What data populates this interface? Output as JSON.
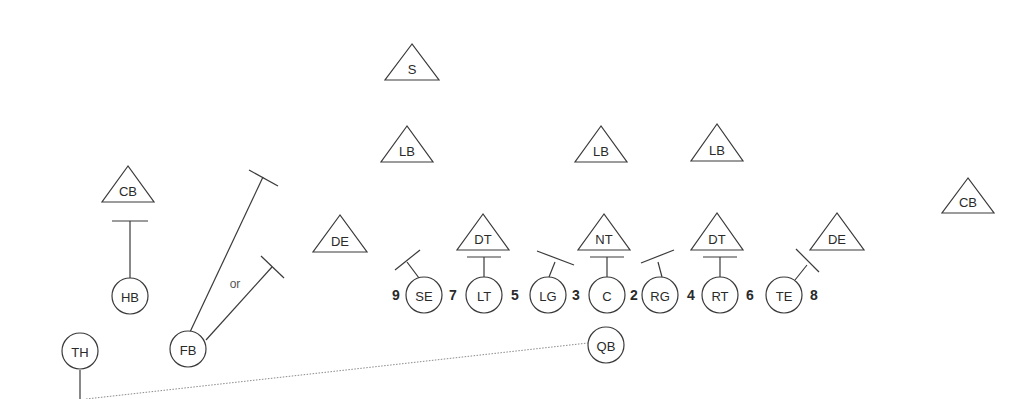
{
  "diagram": {
    "type": "football-play",
    "defense": [
      {
        "label": "S",
        "apex": [
          412,
          44
        ],
        "base_y": 80,
        "half_w": 27
      },
      {
        "label": "LB",
        "apex": [
          407,
          126
        ],
        "base_y": 162,
        "half_w": 26
      },
      {
        "label": "LB",
        "apex": [
          601,
          126
        ],
        "base_y": 162,
        "half_w": 26
      },
      {
        "label": "LB",
        "apex": [
          717,
          124
        ],
        "base_y": 161,
        "half_w": 26
      },
      {
        "label": "CB",
        "apex": [
          128,
          166
        ],
        "base_y": 202,
        "half_w": 26
      },
      {
        "label": "DE",
        "apex": [
          340,
          215
        ],
        "base_y": 252,
        "half_w": 27
      },
      {
        "label": "DT",
        "apex": [
          483,
          214
        ],
        "base_y": 250,
        "half_w": 26
      },
      {
        "label": "NT",
        "apex": [
          604,
          214
        ],
        "base_y": 250,
        "half_w": 26
      },
      {
        "label": "DT",
        "apex": [
          717,
          213
        ],
        "base_y": 250,
        "half_w": 26
      },
      {
        "label": "DE",
        "apex": [
          837,
          213
        ],
        "base_y": 250,
        "half_w": 27
      },
      {
        "label": "CB",
        "apex": [
          968,
          178
        ],
        "base_y": 213,
        "half_w": 26
      }
    ],
    "offense": [
      {
        "label": "HB",
        "cx": 130,
        "cy": 296
      },
      {
        "label": "TH",
        "cx": 80,
        "cy": 351
      },
      {
        "label": "FB",
        "cx": 188,
        "cy": 349
      },
      {
        "label": "SE",
        "cx": 424,
        "cy": 295
      },
      {
        "label": "LT",
        "cx": 484,
        "cy": 295
      },
      {
        "label": "LG",
        "cx": 548,
        "cy": 295
      },
      {
        "label": "C",
        "cx": 607,
        "cy": 295
      },
      {
        "label": "RG",
        "cx": 660,
        "cy": 295
      },
      {
        "label": "RT",
        "cx": 720,
        "cy": 295
      },
      {
        "label": "TE",
        "cx": 784,
        "cy": 295
      },
      {
        "label": "QB",
        "cx": 606,
        "cy": 345
      }
    ],
    "gap_numbers": [
      {
        "label": "9",
        "x": 396,
        "y": 295
      },
      {
        "label": "7",
        "x": 453,
        "y": 295
      },
      {
        "label": "5",
        "x": 515,
        "y": 295
      },
      {
        "label": "3",
        "x": 576,
        "y": 295
      },
      {
        "label": "2",
        "x": 634,
        "y": 295
      },
      {
        "label": "4",
        "x": 691,
        "y": 295
      },
      {
        "label": "6",
        "x": 750,
        "y": 295
      },
      {
        "label": "8",
        "x": 814,
        "y": 295
      }
    ],
    "or_label": "or",
    "circle_radius": 18
  }
}
